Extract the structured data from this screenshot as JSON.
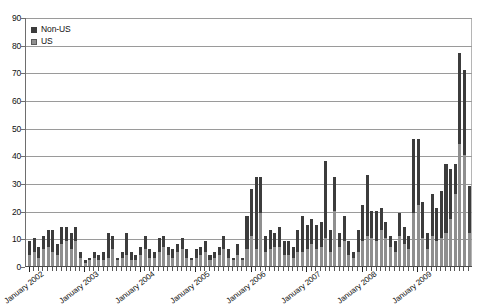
{
  "chart_data": {
    "type": "bar",
    "title": "",
    "xlabel": "",
    "ylabel": "",
    "ylim": [
      0,
      90
    ],
    "ytick_step": 10,
    "yticks": [
      0,
      10,
      20,
      30,
      40,
      50,
      60,
      70,
      80,
      90
    ],
    "grid": true,
    "stacked": true,
    "legend_position": "top-left",
    "legend": [
      "Non-US",
      "US"
    ],
    "colors": {
      "non_us": "#3c3c3c",
      "us": "#8f8f8f",
      "grid": "#9a9a9a",
      "axis": "#4a4a4a"
    },
    "x_major_tick_labels": [
      "January 2002",
      "January 2003",
      "January 2004",
      "January 2005",
      "January 2006",
      "January 2007",
      "January 2008",
      "January 2009"
    ],
    "x_major_tick_indices": [
      0,
      12,
      24,
      36,
      48,
      60,
      72,
      84
    ],
    "categories": [
      "Jan 2002",
      "Feb 2002",
      "Mar 2002",
      "Apr 2002",
      "May 2002",
      "Jun 2002",
      "Jul 2002",
      "Aug 2002",
      "Sep 2002",
      "Oct 2002",
      "Nov 2002",
      "Dec 2002",
      "Jan 2003",
      "Feb 2003",
      "Mar 2003",
      "Apr 2003",
      "May 2003",
      "Jun 2003",
      "Jul 2003",
      "Aug 2003",
      "Sep 2003",
      "Oct 2003",
      "Nov 2003",
      "Dec 2003",
      "Jan 2004",
      "Feb 2004",
      "Mar 2004",
      "Apr 2004",
      "May 2004",
      "Jun 2004",
      "Jul 2004",
      "Aug 2004",
      "Sep 2004",
      "Oct 2004",
      "Nov 2004",
      "Dec 2004",
      "Jan 2005",
      "Feb 2005",
      "Mar 2005",
      "Apr 2005",
      "May 2005",
      "Jun 2005",
      "Jul 2005",
      "Aug 2005",
      "Sep 2005",
      "Oct 2005",
      "Nov 2005",
      "Dec 2005",
      "Jan 2006",
      "Feb 2006",
      "Mar 2006",
      "Apr 2006",
      "May 2006",
      "Jun 2006",
      "Jul 2006",
      "Aug 2006",
      "Sep 2006",
      "Oct 2006",
      "Nov 2006",
      "Dec 2006",
      "Jan 2007",
      "Feb 2007",
      "Mar 2007",
      "Apr 2007",
      "May 2007",
      "Jun 2007",
      "Jul 2007",
      "Aug 2007",
      "Sep 2007",
      "Oct 2007",
      "Nov 2007",
      "Dec 2007",
      "Jan 2008",
      "Feb 2008",
      "Mar 2008",
      "Apr 2008",
      "May 2008",
      "Jun 2008",
      "Jul 2008",
      "Aug 2008",
      "Sep 2008",
      "Oct 2008",
      "Nov 2008",
      "Dec 2008",
      "Jan 2009",
      "Feb 2009",
      "Mar 2009",
      "Apr 2009",
      "May 2009",
      "Jun 2009",
      "Jul 2009",
      "Aug 2009",
      "Sep 2009",
      "Oct 2009",
      "Nov 2009",
      "Dec 2009"
    ],
    "series": [
      {
        "name": "US",
        "values": [
          4,
          5,
          3,
          6,
          7,
          5,
          4,
          8,
          9,
          6,
          9,
          3,
          1,
          2,
          3,
          2,
          2,
          3,
          6,
          2,
          3,
          4,
          2,
          2,
          4,
          6,
          3,
          3,
          5,
          7,
          4,
          3,
          5,
          6,
          3,
          2,
          3,
          4,
          5,
          2,
          3,
          4,
          6,
          3,
          2,
          4,
          2,
          6,
          11,
          6,
          19,
          5,
          6,
          7,
          7,
          4,
          4,
          3,
          5,
          5,
          6,
          8,
          6,
          7,
          10,
          5,
          20,
          7,
          9,
          4,
          3,
          5,
          9,
          11,
          10,
          9,
          13,
          10,
          7,
          5,
          11,
          8,
          6,
          19,
          22,
          10,
          6,
          11,
          9,
          10,
          12,
          17,
          26,
          44,
          40,
          12
        ]
      },
      {
        "name": "Non-US",
        "values": [
          5,
          5,
          4,
          5,
          6,
          8,
          4,
          6,
          5,
          6,
          5,
          2,
          1,
          1,
          2,
          2,
          3,
          9,
          5,
          1,
          2,
          8,
          3,
          2,
          3,
          5,
          3,
          2,
          5,
          4,
          3,
          3,
          3,
          4,
          3,
          1,
          3,
          3,
          4,
          2,
          2,
          3,
          5,
          3,
          1,
          4,
          1,
          12,
          17,
          26,
          13,
          6,
          7,
          5,
          7,
          5,
          5,
          4,
          8,
          13,
          9,
          9,
          9,
          9,
          28,
          8,
          12,
          5,
          9,
          5,
          2,
          8,
          13,
          22,
          10,
          11,
          8,
          6,
          4,
          4,
          8,
          6,
          5,
          27,
          24,
          13,
          6,
          15,
          12,
          17,
          25,
          18,
          11,
          33,
          31,
          17
        ]
      }
    ],
    "totals_note": "Stacked totals peak near 77, 76 and 71 in late 2009"
  },
  "legend": {
    "items": [
      {
        "label": "Non-US",
        "swatch": "legend-swatch-non-us"
      },
      {
        "label": "US",
        "swatch": "legend-swatch-us"
      }
    ]
  },
  "axis": {
    "y_labels": [
      "90",
      "80",
      "70",
      "60",
      "50",
      "40",
      "30",
      "20",
      "10",
      "0"
    ],
    "x_labels": [
      "January 2002",
      "January 2003",
      "January 2004",
      "January 2005",
      "January 2006",
      "January 2007",
      "January 2008",
      "January 2009"
    ]
  }
}
